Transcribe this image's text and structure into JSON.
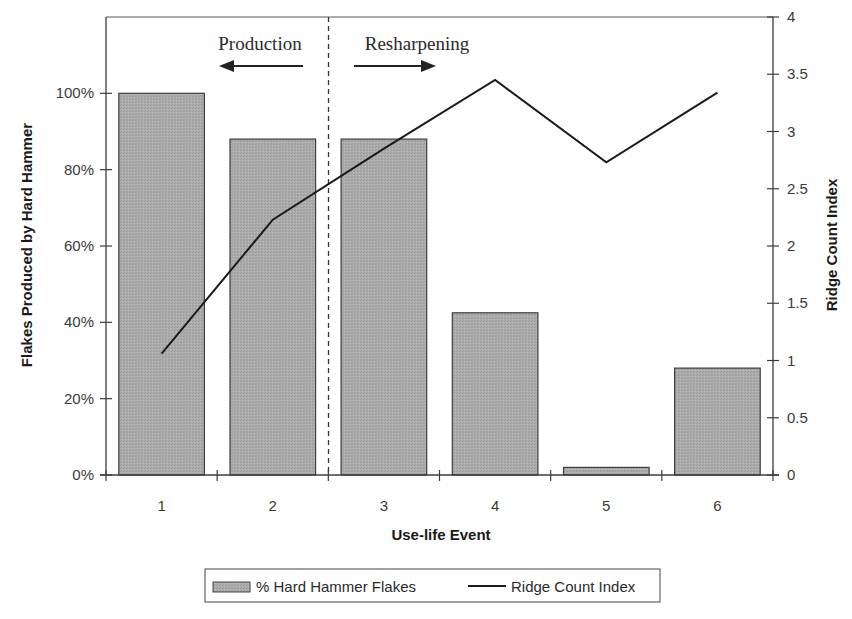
{
  "chart_data": {
    "type": "bar+line",
    "title": "",
    "xlabel": "Use-life Event",
    "ylabel_left": "Flakes Produced by Hard Hammer",
    "ylabel_right": "Ridge Count Index",
    "categories": [
      "1",
      "2",
      "3",
      "4",
      "5",
      "6"
    ],
    "series": [
      {
        "name": "% Hard Hammer Flakes",
        "type": "bar",
        "axis": "left",
        "values": [
          100,
          88,
          88,
          42.5,
          2,
          28
        ],
        "unit": "%"
      },
      {
        "name": "Ridge Count Index",
        "type": "line",
        "axis": "right",
        "values": [
          1.06,
          2.23,
          2.85,
          3.45,
          2.73,
          3.34
        ]
      }
    ],
    "ylim_left": [
      0,
      120
    ],
    "yticks_left": [
      "0%",
      "20%",
      "40%",
      "60%",
      "80%",
      "100%"
    ],
    "ylim_right": [
      0,
      4
    ],
    "yticks_right": [
      "0",
      "0.5",
      "1",
      "1.5",
      "2",
      "2.5",
      "3",
      "3.5",
      "4"
    ],
    "grid": false,
    "legend_position": "bottom",
    "annotations": [
      {
        "text": "Production",
        "arrow": "left"
      },
      {
        "text": "Resharpening",
        "arrow": "right"
      }
    ],
    "divider_after_category": "2"
  },
  "legend": {
    "bar_label": "% Hard Hammer Flakes",
    "line_label": "Ridge Count Index"
  },
  "colors": {
    "bar_fill": "#a9a9a9",
    "bar_stroke": "#3c3c3c",
    "line": "#1a1a1a",
    "axis": "#3c3c3c"
  }
}
